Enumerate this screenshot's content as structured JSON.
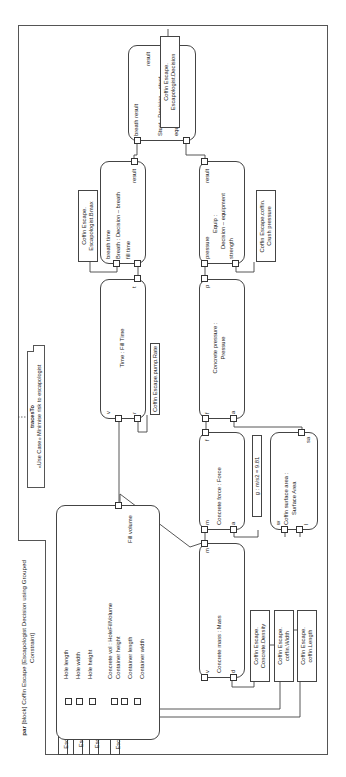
{
  "diagram": {
    "frame_title": {
      "keyword": "par",
      "text": "[block] Coffin Escape [Escapologist Decision using Grouped Constraint]"
    },
    "note": {
      "stereotype": "tracesTo",
      "text": "«Use Case» Minimise risk to escapologist"
    },
    "constraint_blocks": {
      "fill_volume": {
        "title": "Concrete vol : HoleFillVolume",
        "params": [
          "Hole length",
          "Hole width",
          "Hole height",
          "Container height",
          "Container length",
          "Container width"
        ],
        "output": "Fill volume"
      },
      "fill_time": {
        "title": "Time : Fill Time",
        "params": {
          "v": "v",
          "r": "r",
          "t": "t"
        }
      },
      "breath": {
        "title": "Breath : Decision – breath",
        "params": {
          "breath_time": "breath time",
          "fill_time": "fill time",
          "result": "result"
        }
      },
      "stunt": {
        "title": "Stunt : Decision – stunt",
        "params": {
          "breath_result": "breath result",
          "equipment_result": "equipment result",
          "result": "result"
        }
      },
      "equip": {
        "title_1": "Equip :",
        "title_2": "Decision – equipment",
        "params": {
          "pressure": "pressure",
          "strength": "strength",
          "result": "result"
        }
      },
      "pressure": {
        "title_1": "Concrete pressure :",
        "title_2": "Pressure",
        "params": {
          "f": "f",
          "a": "a",
          "p": "p"
        }
      },
      "force": {
        "title": "Concrete force : Force",
        "params": {
          "m": "m",
          "a": "a",
          "f": "f"
        }
      },
      "mass": {
        "title": "Concrete mass : Mass",
        "params": {
          "v": "v",
          "d": "d",
          "m": "m"
        }
      },
      "area": {
        "title_1": "Coffin surface area :",
        "title_2": "Surface Area",
        "params": {
          "w": "w",
          "l": "l",
          "sa": "sa"
        }
      }
    },
    "value_properties": {
      "hole_length": "Coffin Escape.hole.Length",
      "hole_width": "Coffin Escape.hole.Width",
      "hole_height": "Coffin Escape.hole.Height",
      "coffin_height": "Coffin Escape.coffin.Height",
      "pump_rate": "Coffin Escape.pump.Rate",
      "bmax_1": "Coffin Escape.",
      "bmax_2": "Escapologist.Bmax",
      "decision_1": "Coffin Escape.",
      "decision_2": "Escapologist.Decision",
      "crush_1": "Coffin Escape.coffin.",
      "crush_2": "Crush pressure",
      "density_1": "Coffin Escape.",
      "density_2": "Concrete.Density",
      "cwidth_1": "Coffin Escape.",
      "cwidth_2": "coffin.Width",
      "clength_1": "Coffin Escape.",
      "clength_2": "coffin.Length",
      "gravity": "g : m/s2 = 9.81"
    }
  }
}
